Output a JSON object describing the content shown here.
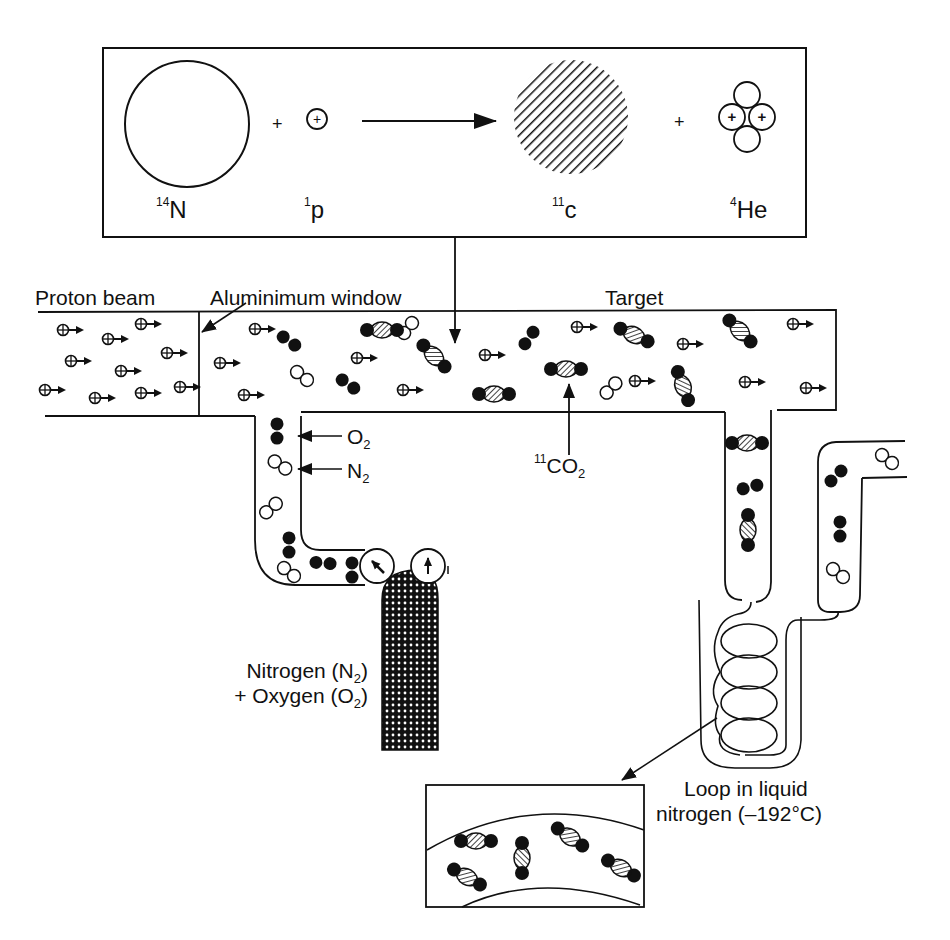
{
  "reaction": {
    "reactants": [
      {
        "isotope_mass": "14",
        "symbol": "N"
      },
      {
        "isotope_mass": "1",
        "symbol": "p"
      }
    ],
    "products": [
      {
        "isotope_mass": "11",
        "symbol": "c"
      },
      {
        "isotope_mass": "4",
        "symbol": "He"
      }
    ],
    "plus_sign": "+",
    "proton_glyph": "+"
  },
  "labels": {
    "proton_beam": "Proton beam",
    "aluminium_window": "Aluminimum window",
    "target": "Target",
    "o2": {
      "base": "O",
      "sub": "2"
    },
    "n2": {
      "base": "N",
      "sub": "2"
    },
    "co2": {
      "sup": "11",
      "base": "CO",
      "sub": "2"
    },
    "gas_supply_line1": {
      "text": "Nitrogen (N",
      "sub": "2",
      "close": ")"
    },
    "gas_supply_line2": {
      "text": "+ Oxygen (O",
      "sub": "2",
      "close": ")"
    },
    "loop_line1": "Loop in liquid",
    "loop_line2": "nitrogen (–192°C)"
  },
  "legend_icons": {
    "proton": "circle-plus-arrow-icon",
    "oxygen_molecule": "filled-double-circle-icon",
    "nitrogen_molecule": "open-double-circle-icon",
    "carbon_dioxide": "hatched-triatomic-icon"
  }
}
